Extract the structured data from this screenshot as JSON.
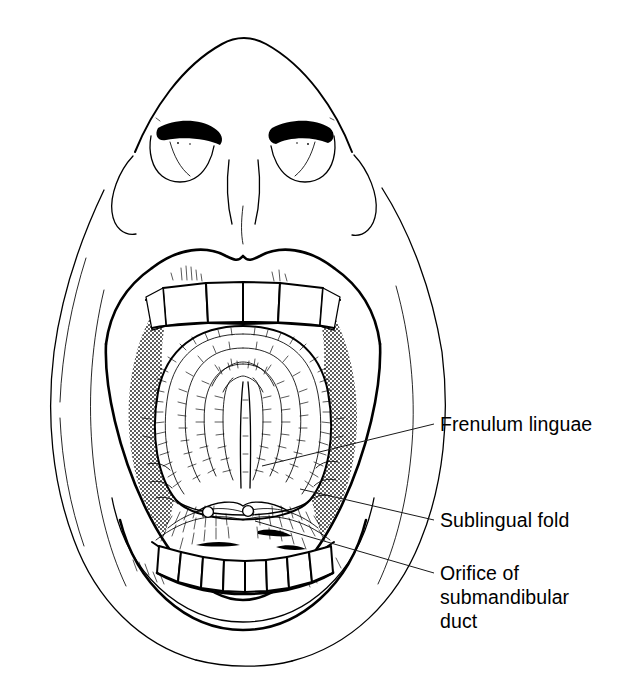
{
  "figure": {
    "kind": "anatomical-line-drawing",
    "background_color": "#ffffff",
    "ink_color": "#000000",
    "style": "black-and-white pen-and-ink medical illustration with halftone stipple shading"
  },
  "labels": [
    {
      "id": "frenulum-linguae",
      "text": "Frenulum linguae",
      "lines": [
        "Frenulum linguae"
      ],
      "text_x": 440,
      "text_y": 431,
      "leader": {
        "x1": 262,
        "y1": 466,
        "x2": 434,
        "y2": 424
      }
    },
    {
      "id": "sublingual-fold",
      "text": "Sublingual fold",
      "lines": [
        "Sublingual fold"
      ],
      "text_x": 440,
      "text_y": 527,
      "leader": {
        "x1": 300,
        "y1": 489,
        "x2": 434,
        "y2": 520
      }
    },
    {
      "id": "orifice-of-submandibular-duct",
      "text": "Orifice of submandibular duct",
      "lines": [
        "Orifice of",
        "submandibular",
        "duct"
      ],
      "text_x": 440,
      "text_y": 580,
      "line_height": 24,
      "leader": {
        "x1": 255,
        "y1": 521,
        "x2": 434,
        "y2": 573
      }
    }
  ],
  "structures": [
    {
      "id": "nose",
      "name": "Nose seen from below"
    },
    {
      "id": "nostril-left",
      "name": "Left nostril (naris)"
    },
    {
      "id": "nostril-right",
      "name": "Right nostril (naris)"
    },
    {
      "id": "philtrum",
      "name": "Philtrum"
    },
    {
      "id": "upper-lip",
      "name": "Upper lip"
    },
    {
      "id": "lower-lip",
      "name": "Lower lip"
    },
    {
      "id": "upper-incisors",
      "name": "Upper incisor teeth",
      "count": 4
    },
    {
      "id": "lower-incisors",
      "name": "Lower incisor teeth",
      "count": 7
    },
    {
      "id": "tongue-underside",
      "name": "Inferior surface of the tongue"
    },
    {
      "id": "frenulum",
      "name": "Frenulum linguae (lingual frenulum)"
    },
    {
      "id": "sublingual-fold-structure",
      "name": "Sublingual fold (plica sublingualis)"
    },
    {
      "id": "duct-orifice-left",
      "name": "Left orifice of submandibular duct"
    },
    {
      "id": "duct-orifice-right",
      "name": "Right orifice of submandibular duct"
    },
    {
      "id": "oral-vestibule",
      "name": "Oral vestibule, stipple-shaded"
    },
    {
      "id": "cheek-contours",
      "name": "Cheek contour lines"
    },
    {
      "id": "jaw-outline",
      "name": "Jaw and chin outline"
    }
  ]
}
